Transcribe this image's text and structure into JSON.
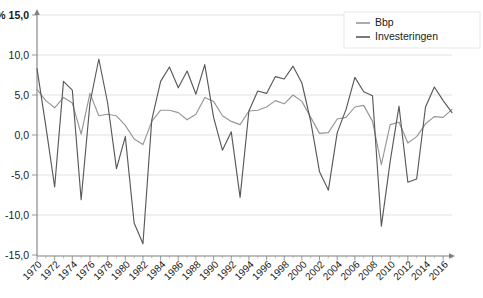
{
  "chart_data": {
    "type": "line",
    "title": "",
    "subtitle": "",
    "xlabel": "",
    "ylabel": "",
    "unit_label": "%",
    "ylim": [
      -15.0,
      15.0
    ],
    "xlim": [
      1970,
      2017
    ],
    "grid": true,
    "legend_position": "top-right",
    "y_ticks": [
      "15,0",
      "10,0",
      "5,0",
      "0,0",
      "-5,0",
      "-10,0",
      "-15,0"
    ],
    "y_tick_values": [
      15.0,
      10.0,
      5.0,
      0.0,
      -5.0,
      -10.0,
      -15.0
    ],
    "x_tick_labels": [
      "1970",
      "1972",
      "1974",
      "1976",
      "1978",
      "1980",
      "1982",
      "1984",
      "1986",
      "1988",
      "1990",
      "1992",
      "1994",
      "1996",
      "1998",
      "2000",
      "2002",
      "2004",
      "2006",
      "2008",
      "2010",
      "2012",
      "2014",
      "2016"
    ],
    "x_tick_values": [
      1970,
      1972,
      1974,
      1976,
      1978,
      1980,
      1982,
      1984,
      1986,
      1988,
      1990,
      1992,
      1994,
      1996,
      1998,
      2000,
      2002,
      2004,
      2006,
      2008,
      2010,
      2012,
      2014,
      2016
    ],
    "x": [
      1970,
      1971,
      1972,
      1973,
      1974,
      1975,
      1976,
      1977,
      1978,
      1979,
      1980,
      1981,
      1982,
      1983,
      1984,
      1985,
      1986,
      1987,
      1988,
      1989,
      1990,
      1991,
      1992,
      1993,
      1994,
      1995,
      1996,
      1997,
      1998,
      1999,
      2000,
      2001,
      2002,
      2003,
      2004,
      2005,
      2006,
      2007,
      2008,
      2009,
      2010,
      2011,
      2012,
      2013,
      2014,
      2015,
      2016,
      2017
    ],
    "series": [
      {
        "name": "Bbp",
        "color": "#969696",
        "values": [
          5.7,
          4.3,
          3.4,
          4.7,
          4.0,
          0.1,
          5.2,
          2.4,
          2.6,
          2.4,
          1.2,
          -0.5,
          -1.2,
          1.7,
          3.1,
          3.1,
          2.8,
          1.9,
          2.6,
          4.7,
          4.2,
          2.4,
          1.7,
          1.3,
          3.0,
          3.1,
          3.5,
          4.3,
          3.9,
          5.0,
          4.2,
          2.2,
          0.2,
          0.3,
          2.0,
          2.2,
          3.5,
          3.7,
          1.7,
          -3.7,
          1.3,
          1.6,
          -1.0,
          -0.2,
          1.4,
          2.3,
          2.2,
          3.2
        ]
      },
      {
        "name": "Investeringen",
        "color": "#595959",
        "values": [
          8.3,
          1.1,
          -6.5,
          6.7,
          5.6,
          -8.1,
          4.0,
          9.5,
          4.0,
          -4.2,
          -0.2,
          -11.0,
          -13.6,
          1.9,
          6.7,
          8.5,
          5.9,
          8.0,
          5.1,
          8.8,
          2.2,
          -1.9,
          0.4,
          -7.8,
          3.0,
          5.5,
          5.2,
          7.3,
          7.0,
          8.6,
          6.5,
          1.7,
          -4.6,
          -6.9,
          0.3,
          3.2,
          7.2,
          5.4,
          4.9,
          -11.4,
          -3.3,
          3.6,
          -5.9,
          -5.5,
          3.5,
          6.0,
          4.3,
          2.8
        ]
      }
    ]
  }
}
